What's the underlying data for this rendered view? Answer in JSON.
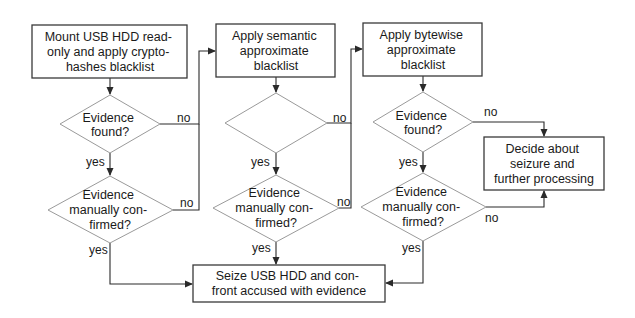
{
  "diagram": {
    "type": "flowchart",
    "colors": {
      "box_stroke": "#3a3a3a",
      "diamond_stroke": "#9a9a9a",
      "edge": "#2a2a2a",
      "text": "#1a1a1a",
      "background": "#ffffff"
    },
    "nodes": {
      "mount": {
        "shape": "rect",
        "lines": [
          "Mount USB HDD read-",
          "only and apply crypto-",
          "hashes blacklist"
        ]
      },
      "q1_found": {
        "shape": "diamond",
        "lines": [
          "Evidence",
          "found?"
        ]
      },
      "q1_confirmed": {
        "shape": "diamond",
        "lines": [
          "Evidence",
          "manually con-",
          "firmed?"
        ]
      },
      "semantic": {
        "shape": "rect",
        "lines": [
          "Apply semantic",
          "approximate",
          "blacklist"
        ]
      },
      "q2_found": {
        "shape": "diamond",
        "lines": []
      },
      "q2_confirmed": {
        "shape": "diamond",
        "lines": [
          "Evidence",
          "manually con-",
          "firmed?"
        ]
      },
      "bytewise": {
        "shape": "rect",
        "lines": [
          "Apply bytewise",
          "approximate",
          "blacklist"
        ]
      },
      "q3_found": {
        "shape": "diamond",
        "lines": [
          "Evidence",
          "found?"
        ]
      },
      "q3_confirmed": {
        "shape": "diamond",
        "lines": [
          "Evidence",
          "manually con-",
          "firmed?"
        ]
      },
      "decide": {
        "shape": "rect",
        "lines": [
          "Decide about",
          "seizure and",
          "further processing"
        ]
      },
      "seize": {
        "shape": "rect",
        "lines": [
          "Seize USB HDD and con-",
          "front accused with evidence"
        ]
      }
    },
    "edges": [
      {
        "from": "mount",
        "to": "q1_found",
        "label": ""
      },
      {
        "from": "q1_found",
        "to": "q1_confirmed",
        "label": "yes"
      },
      {
        "from": "q1_found",
        "to": "semantic",
        "label": "no"
      },
      {
        "from": "q1_confirmed",
        "to": "semantic",
        "label": "no"
      },
      {
        "from": "q1_confirmed",
        "to": "seize",
        "label": "yes"
      },
      {
        "from": "semantic",
        "to": "q2_found",
        "label": ""
      },
      {
        "from": "q2_found",
        "to": "q2_confirmed",
        "label": "yes"
      },
      {
        "from": "q2_found",
        "to": "bytewise",
        "label": "no"
      },
      {
        "from": "q2_confirmed",
        "to": "bytewise",
        "label": "no"
      },
      {
        "from": "q2_confirmed",
        "to": "seize",
        "label": "yes"
      },
      {
        "from": "bytewise",
        "to": "q3_found",
        "label": ""
      },
      {
        "from": "q3_found",
        "to": "q3_confirmed",
        "label": "yes"
      },
      {
        "from": "q3_found",
        "to": "decide",
        "label": "no"
      },
      {
        "from": "q3_confirmed",
        "to": "decide",
        "label": "no"
      },
      {
        "from": "q3_confirmed",
        "to": "seize",
        "label": "yes"
      }
    ],
    "labels": {
      "yes": "yes",
      "no": "no"
    }
  }
}
